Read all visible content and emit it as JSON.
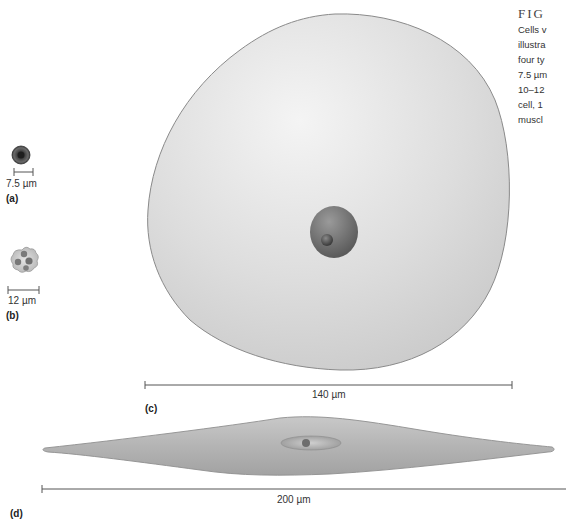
{
  "caption": {
    "figure_label": "FIG",
    "lines": [
      "Cells v",
      "illustra",
      "four ty",
      "7.5 µm",
      "10–12",
      "cell, 1",
      "muscl"
    ]
  },
  "panels": [
    {
      "id": "a",
      "label": "(a)",
      "scale_label": "7.5 µm",
      "cell": "red-blood-cell"
    },
    {
      "id": "b",
      "label": "(b)",
      "scale_label": "12 µm",
      "cell": "white-blood-cell"
    },
    {
      "id": "c",
      "label": "(c)",
      "scale_label": "140 µm",
      "cell": "egg-cell"
    },
    {
      "id": "d",
      "label": "(d)",
      "scale_label": "200 µm",
      "cell": "smooth-muscle-cell"
    }
  ],
  "colors": {
    "cell_fill": "#dcdcdc",
    "cell_outline": "#8a8a8a",
    "nucleus": "#6e6e6e",
    "scale_bar": "#555555"
  }
}
